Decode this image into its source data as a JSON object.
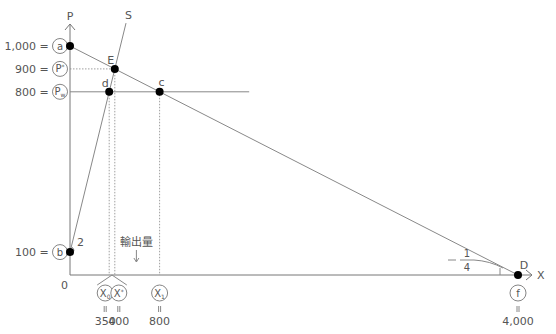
{
  "chart_data": {
    "type": "line",
    "title": "",
    "xlabel": "X",
    "ylabel": "P",
    "origin_label": "0",
    "xlim": [
      0,
      4000
    ],
    "ylim": [
      0,
      1000
    ],
    "grid": false,
    "series": [
      {
        "name": "D",
        "kind": "demand",
        "points": [
          [
            0,
            1000
          ],
          [
            4000,
            0
          ]
        ],
        "slope_label_num": "1",
        "slope_label_den": "4",
        "slope_label_sign": "−"
      },
      {
        "name": "S",
        "kind": "supply",
        "points": [
          [
            0,
            100
          ],
          [
            500,
            1100
          ]
        ],
        "slope_label": "2"
      },
      {
        "name": "Pw",
        "kind": "world-price",
        "points": [
          [
            0,
            800
          ],
          [
            1600,
            800
          ]
        ]
      }
    ],
    "points": [
      {
        "label": "a",
        "x": 0,
        "y": 1000
      },
      {
        "label": "b",
        "x": 0,
        "y": 100
      },
      {
        "label": "E",
        "x": 400,
        "y": 900
      },
      {
        "label": "d",
        "x": 350,
        "y": 800
      },
      {
        "label": "c",
        "x": 800,
        "y": 800
      },
      {
        "label": "D",
        "x": 4000,
        "y": 0
      }
    ],
    "y_ticks": [
      {
        "value": 1000,
        "text": "1,000",
        "eq": "=",
        "circle": "a"
      },
      {
        "value": 900,
        "text": "900",
        "eq": "=",
        "circle": "P*"
      },
      {
        "value": 800,
        "text": "800",
        "eq": "=",
        "circle": "Pw"
      },
      {
        "value": 100,
        "text": "100",
        "eq": "=",
        "circle": "b"
      }
    ],
    "x_ticks": [
      {
        "value": 350,
        "circle": "X0",
        "eq": "॥",
        "text": "350"
      },
      {
        "value": 400,
        "circle": "X*",
        "eq": "॥",
        "text": "400"
      },
      {
        "value": 800,
        "circle": "X1",
        "eq": "॥",
        "text": "800"
      },
      {
        "value": 4000,
        "circle": "f",
        "eq": "॥",
        "text": "4,000"
      }
    ],
    "annotations": [
      {
        "text": "輸出量",
        "range": [
          350,
          800
        ],
        "arrow": "down"
      }
    ]
  }
}
